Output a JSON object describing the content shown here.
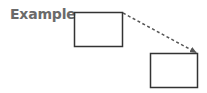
{
  "diagram": {
    "label": "Example",
    "colors": {
      "label": "#6a6a6a",
      "stroke": "#333333",
      "arrow": "#555555"
    },
    "boxes": [
      {
        "id": "box-1",
        "x": 74.5,
        "y": 12.5,
        "w": 48,
        "h": 34
      },
      {
        "id": "box-2",
        "x": 150.5,
        "y": 53.5,
        "w": 47,
        "h": 34
      }
    ],
    "connector": {
      "from": "box-1",
      "to": "box-2",
      "style": "dashed",
      "arrowhead": true
    }
  }
}
